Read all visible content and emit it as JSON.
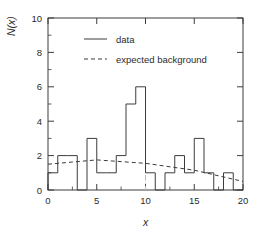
{
  "chart_data": {
    "type": "bar",
    "subtype": "step-histogram",
    "title": "",
    "xlabel": "x",
    "ylabel": "N(x)",
    "xlim": [
      0,
      20
    ],
    "ylim": [
      0,
      10
    ],
    "xticks": [
      0,
      5,
      10,
      15,
      20
    ],
    "yticks": [
      0,
      2,
      4,
      6,
      8,
      10
    ],
    "xtick_labels": [
      "0",
      "5",
      "10",
      "15",
      "20"
    ],
    "ytick_labels": [
      "0",
      "2",
      "4",
      "6",
      "8",
      "10"
    ],
    "minor_ticks": true,
    "grid": false,
    "bin_width": 1,
    "bin_edges": [
      0,
      1,
      2,
      3,
      4,
      5,
      6,
      7,
      8,
      9,
      10,
      11,
      12,
      13,
      14,
      15,
      16,
      17,
      18,
      19,
      20
    ],
    "series": [
      {
        "name": "data",
        "style": "solid",
        "color": "#3c3c3c",
        "values": [
          1,
          2,
          2,
          0,
          3,
          1,
          1,
          2,
          5,
          6,
          1,
          0,
          1,
          2,
          1,
          3,
          1,
          0,
          1,
          0
        ]
      },
      {
        "name": "expected background",
        "style": "dashed",
        "color": "#3c3c3c",
        "x": [
          0,
          5,
          10,
          15,
          20
        ],
        "values": [
          1.5,
          1.75,
          1.55,
          1.15,
          0.5
        ]
      }
    ],
    "annotations": [
      {
        "name": "peak-marker",
        "type": "vline",
        "x": 10,
        "style": "dash-dot",
        "color": "#b9b9b9"
      }
    ],
    "legend": {
      "position": "upper-left-inside",
      "entries": [
        {
          "label": "data",
          "style": "solid"
        },
        {
          "label": "expected background",
          "style": "dashed"
        }
      ]
    }
  },
  "legend": {
    "data_label": "data",
    "background_label": "expected background"
  },
  "axes": {
    "x_title": "x",
    "y_title": "N(x)"
  }
}
